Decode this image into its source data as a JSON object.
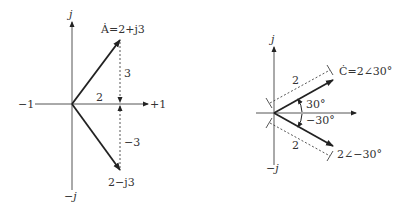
{
  "left_diagram": {
    "axis_labels": {
      "pos_imag": "j",
      "neg_imag": "−j",
      "neg_real": "−1",
      "pos_real": "+1"
    },
    "phasor_a_label": "Ȧ=2+j3",
    "phasor_b_label": "2−j3",
    "real_component_label": "2",
    "imag_pos_label": "3",
    "imag_neg_label": "−3"
  },
  "right_diagram": {
    "axis_labels": {
      "pos_imag": "j",
      "neg_imag": "−j"
    },
    "phasor_c_label": "Ċ=2∠30°",
    "phasor_d_label": "2∠−30°",
    "magnitude_upper_label": "2",
    "magnitude_lower_label": "2",
    "angle_pos_label": "30°",
    "angle_neg_label": "−30°"
  },
  "colors": {
    "line": "#222222",
    "text": "#333333",
    "dash": "#444444"
  }
}
